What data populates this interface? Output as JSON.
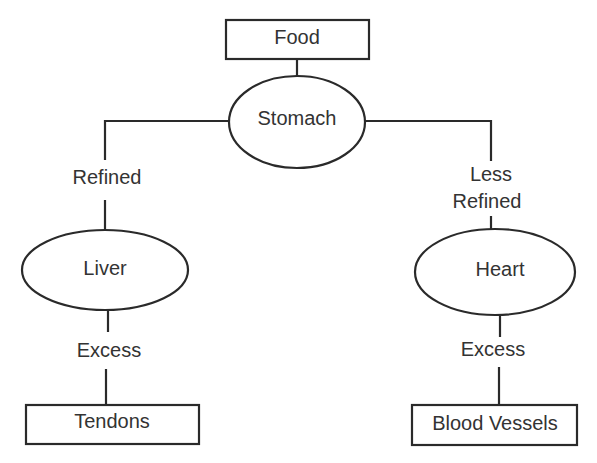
{
  "diagram": {
    "type": "flowchart",
    "nodes": {
      "food": "Food",
      "stomach": "Stomach",
      "liver": "Liver",
      "heart": "Heart",
      "tendons": "Tendons",
      "blood_vessels": "Blood Vessels"
    },
    "edge_labels": {
      "refined": "Refined",
      "less_refined_line1": "Less",
      "less_refined_line2": "Refined",
      "excess_left": "Excess",
      "excess_right": "Excess"
    },
    "edges": [
      {
        "from": "Food",
        "to": "Stomach",
        "label": ""
      },
      {
        "from": "Stomach",
        "to": "Liver",
        "label": "Refined"
      },
      {
        "from": "Stomach",
        "to": "Heart",
        "label": "Less Refined"
      },
      {
        "from": "Liver",
        "to": "Tendons",
        "label": "Excess"
      },
      {
        "from": "Heart",
        "to": "Blood Vessels",
        "label": "Excess"
      }
    ]
  }
}
